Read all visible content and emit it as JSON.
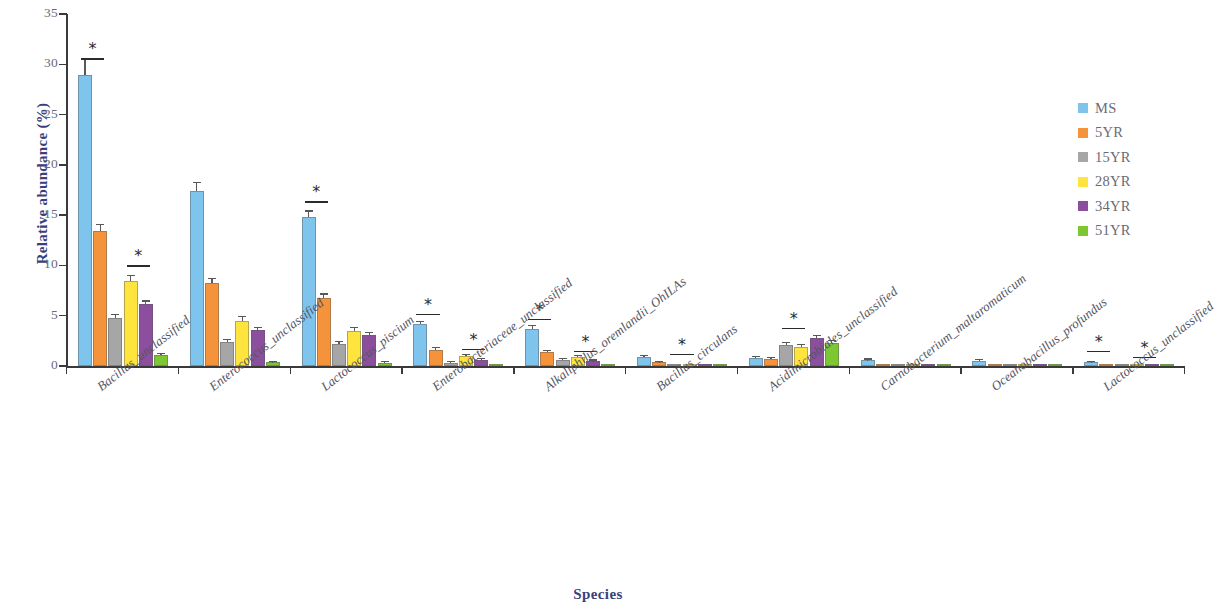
{
  "chart_data": {
    "type": "bar",
    "title": "",
    "xlabel": "Species",
    "ylabel": "Relative abundance (%)",
    "ylim": [
      0,
      35
    ],
    "yticks": [
      0,
      5,
      10,
      15,
      20,
      25,
      30,
      35
    ],
    "grid": false,
    "legend_position": "right",
    "categories": [
      "Bacillus_unclassified",
      "Enterococcus_unclassified",
      "Lactococcus_piscium",
      "Enterobacteriaceae_unclassified",
      "Alkaliphilus_oremlandii_OhILAs",
      "Bacillus_circulans",
      "Acidimicrobiales_unclassified",
      "Carnobacterium_maltaromaticum",
      "Oceanobacillus_profundus",
      "Lactococcus_unclassified"
    ],
    "series": [
      {
        "name": "MS",
        "color": "#7FC4ED",
        "values": [
          28.9,
          17.4,
          14.8,
          4.15,
          3.65,
          0.85,
          0.8,
          0.55,
          0.5,
          0.35
        ],
        "errors": [
          1.65,
          0.75,
          0.55,
          0.25,
          0.3,
          0.1,
          0.12,
          0.08,
          0.07,
          0.08
        ]
      },
      {
        "name": "5YR",
        "color": "#F5933B",
        "values": [
          13.4,
          8.3,
          6.8,
          1.6,
          1.35,
          0.35,
          0.7,
          0.22,
          0.2,
          0.22
        ],
        "errors": [
          0.6,
          0.35,
          0.3,
          0.15,
          0.15,
          0.06,
          0.1,
          0.05,
          0.05,
          0.05
        ]
      },
      {
        "name": "15YR",
        "color": "#A6A6A6",
        "values": [
          4.8,
          2.4,
          2.2,
          0.32,
          0.55,
          0.1,
          2.1,
          0.1,
          0.08,
          0.1
        ],
        "errors": [
          0.25,
          0.2,
          0.18,
          0.06,
          0.1,
          0.03,
          0.2,
          0.03,
          0.03,
          0.03
        ]
      },
      {
        "name": "28YR",
        "color": "#FFE43D",
        "values": [
          8.5,
          4.5,
          3.5,
          1.0,
          0.85,
          0.12,
          1.9,
          0.12,
          0.12,
          0.12
        ],
        "errors": [
          0.45,
          0.35,
          0.25,
          0.12,
          0.12,
          0.03,
          0.18,
          0.03,
          0.03,
          0.03
        ]
      },
      {
        "name": "34YR",
        "color": "#8B4F9E",
        "values": [
          6.2,
          3.6,
          3.1,
          0.62,
          0.45,
          0.1,
          2.8,
          0.1,
          0.1,
          0.1
        ],
        "errors": [
          0.2,
          0.18,
          0.18,
          0.08,
          0.08,
          0.03,
          0.15,
          0.03,
          0.03,
          0.03
        ]
      },
      {
        "name": "51YR",
        "color": "#7DC832",
        "values": [
          1.05,
          0.35,
          0.3,
          0.1,
          0.08,
          0.06,
          2.3,
          0.06,
          0.05,
          0.06
        ],
        "errors": [
          0.1,
          0.06,
          0.06,
          0.03,
          0.03,
          0.02,
          0.18,
          0.02,
          0.02,
          0.02
        ]
      }
    ],
    "significance_markers": [
      {
        "group": 0,
        "from_series": 0,
        "to_series": 1,
        "symbol": "*",
        "top_value": 32.0
      },
      {
        "group": 0,
        "from_series": 3,
        "to_series": 4,
        "symbol": "*",
        "top_value": 11.4
      },
      {
        "group": 2,
        "from_series": 0,
        "to_series": 1,
        "symbol": "*",
        "top_value": 17.8
      },
      {
        "group": 3,
        "from_series": 0,
        "to_series": 1,
        "symbol": "*",
        "top_value": 6.6
      },
      {
        "group": 3,
        "from_series": 3,
        "to_series": 4,
        "symbol": "*",
        "top_value": 3.1
      },
      {
        "group": 4,
        "from_series": 0,
        "to_series": 1,
        "symbol": "*",
        "top_value": 6.1
      },
      {
        "group": 4,
        "from_series": 3,
        "to_series": 4,
        "symbol": "*",
        "top_value": 2.9
      },
      {
        "group": 5,
        "from_series": 2,
        "to_series": 3,
        "symbol": "*",
        "top_value": 2.6
      },
      {
        "group": 6,
        "from_series": 2,
        "to_series": 3,
        "symbol": "*",
        "top_value": 5.2
      },
      {
        "group": 9,
        "from_series": 0,
        "to_series": 1,
        "symbol": "*",
        "top_value": 2.9
      },
      {
        "group": 9,
        "from_series": 3,
        "to_series": 4,
        "symbol": "*",
        "top_value": 2.3
      }
    ]
  },
  "legend": {
    "items": [
      {
        "label": "MS",
        "color": "#7FC4ED"
      },
      {
        "label": "5YR",
        "color": "#F5933B"
      },
      {
        "label": "15YR",
        "color": "#A6A6A6"
      },
      {
        "label": "28YR",
        "color": "#FFE43D"
      },
      {
        "label": "34YR",
        "color": "#8B4F9E"
      },
      {
        "label": "51YR",
        "color": "#7DC832"
      }
    ]
  },
  "axes": {
    "y_title": "Relative abundance (%)",
    "x_title": "Species",
    "y_tick_labels": [
      "0",
      "5",
      "10",
      "15",
      "20",
      "25",
      "30",
      "35"
    ]
  },
  "colors": {
    "axis": "#3a3a3a",
    "tick_text": "#6a6a74",
    "axis_title": "#3b3f7a",
    "category_text": "#55555f",
    "error_bar": "#585858"
  }
}
